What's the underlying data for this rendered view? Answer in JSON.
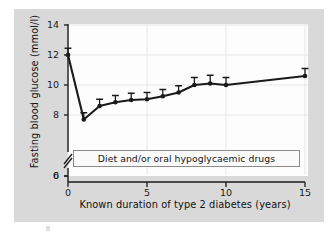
{
  "chart_data": {
    "type": "line",
    "title": "",
    "xlabel": "Known duration of type 2 diabetes (years)",
    "ylabel": "Fasting blood glucose (mmol/l)",
    "xlim": [
      0,
      15
    ],
    "ylim": [
      0,
      14
    ],
    "y_axis_break": {
      "from": 0,
      "to": 6,
      "marker": "double-slash"
    },
    "grid": true,
    "legend": "none",
    "xticks": [
      0,
      5,
      10,
      15
    ],
    "xtick_labels": [
      "0",
      "5",
      "10",
      "15"
    ],
    "yticks": [
      0,
      6,
      8,
      10,
      12,
      14
    ],
    "ytick_labels": [
      "0",
      "6",
      "8",
      "10",
      "12",
      "14"
    ],
    "error_bar_style": "upper-cap-only",
    "marker": "filled-circle",
    "line_color": "#1a1a1a",
    "series": [
      {
        "name": "Fasting blood glucose",
        "x": [
          0,
          1,
          2,
          3,
          4,
          5,
          6,
          7,
          8,
          9,
          10,
          15
        ],
        "values": [
          12.0,
          7.7,
          8.6,
          8.85,
          9.0,
          9.05,
          9.25,
          9.5,
          10.0,
          10.1,
          10.0,
          10.6
        ],
        "errors_upper": [
          0.45,
          0.45,
          0.45,
          0.45,
          0.45,
          0.45,
          0.45,
          0.45,
          0.5,
          0.55,
          0.5,
          0.5
        ]
      }
    ],
    "annotations": [
      {
        "name": "treatment-band",
        "text": "Diet and/or oral hypoglycaemic drugs"
      }
    ]
  },
  "colors": {
    "figure_background": "#d9d9d9",
    "plot_background": "#fdfdfd",
    "axis": "#1a1a1a",
    "grid": "#e6e6e6",
    "annotation_border": "#8c8c8c",
    "page_background": "#ffffff"
  }
}
